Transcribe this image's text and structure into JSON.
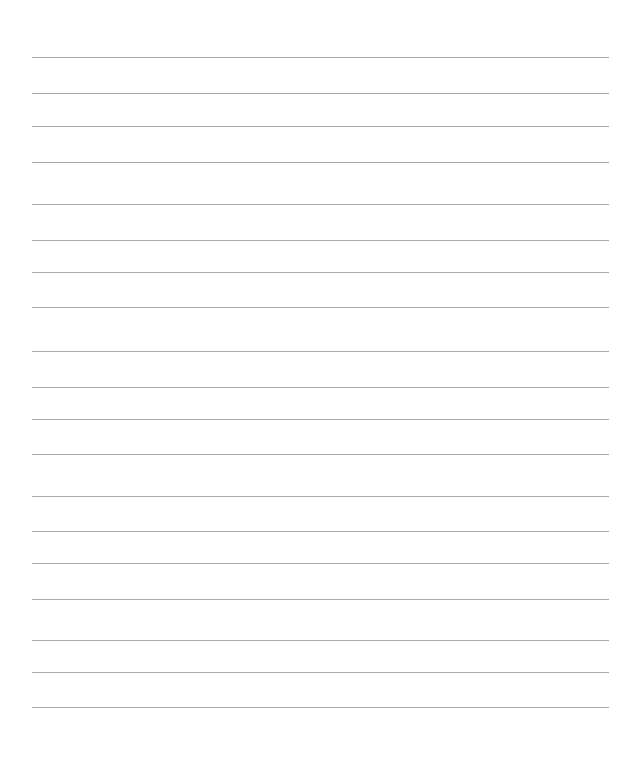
{
  "page": {
    "type": "blank-lined-paper",
    "background_color": "#ffffff",
    "line_color": "#9a9a9a",
    "line_left": 32,
    "line_right": 609,
    "line_positions_y": [
      57,
      93,
      126,
      162,
      204,
      240,
      272,
      307,
      351,
      387,
      419,
      454,
      496,
      531,
      563,
      599,
      640,
      672,
      707
    ]
  }
}
